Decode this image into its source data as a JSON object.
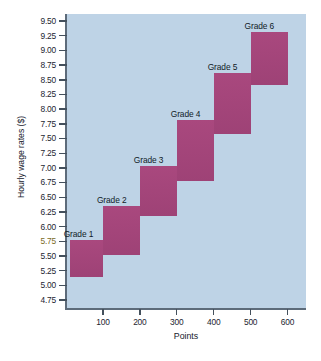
{
  "chart_data": {
    "type": "bar",
    "title": "",
    "xlabel": "Points",
    "ylabel": "Hourly wage rates ($)",
    "xlim": [
      0,
      650
    ],
    "ylim": [
      4.6,
      9.62
    ],
    "grid": false,
    "legend": "none",
    "x_ticks": [
      "100",
      "200",
      "300",
      "400",
      "500",
      "600"
    ],
    "x_tick_values": [
      100,
      200,
      300,
      400,
      500,
      600
    ],
    "y_ticks": [
      "9.50",
      "9.25",
      "9.00",
      "8.75",
      "8.50",
      "8.25",
      "8.00",
      "7.75",
      "7.50",
      "7.25",
      "7.00",
      "6.75",
      "6.50",
      "6.25",
      "6.00",
      "5.75",
      "5.50",
      "5.25",
      "5.00",
      "4.75"
    ],
    "y_tick_values": [
      9.5,
      9.25,
      9.0,
      8.75,
      8.5,
      8.25,
      8.0,
      7.75,
      7.5,
      7.25,
      7.0,
      6.75,
      6.5,
      6.25,
      6.0,
      5.75,
      5.5,
      5.25,
      5.0,
      4.75
    ],
    "highlighted_y_tick": "5.75",
    "plot_background": "#bed3e6",
    "box_color": "#a4477c",
    "series": [
      {
        "name": "Grade 1",
        "x_start": 10,
        "x_end": 100,
        "y_min": 5.15,
        "y_max": 5.78,
        "label": "Grade 1",
        "label_anchor": "top-left"
      },
      {
        "name": "Grade 2",
        "x_start": 100,
        "x_end": 200,
        "y_min": 5.52,
        "y_max": 6.35,
        "label": "Grade 2",
        "label_anchor": "top-left"
      },
      {
        "name": "Grade 3",
        "x_start": 200,
        "x_end": 300,
        "y_min": 6.18,
        "y_max": 7.03,
        "label": "Grade 3",
        "label_anchor": "top-left"
      },
      {
        "name": "Grade 4",
        "x_start": 300,
        "x_end": 400,
        "y_min": 6.77,
        "y_max": 7.82,
        "label": "Grade 4",
        "label_anchor": "top-left"
      },
      {
        "name": "Grade 5",
        "x_start": 400,
        "x_end": 500,
        "y_min": 7.58,
        "y_max": 8.62,
        "label": "Grade 5",
        "label_anchor": "top-left"
      },
      {
        "name": "Grade 6",
        "x_start": 500,
        "x_end": 600,
        "y_min": 8.41,
        "y_max": 9.32,
        "label": "Grade 6",
        "label_anchor": "top-left"
      }
    ]
  }
}
